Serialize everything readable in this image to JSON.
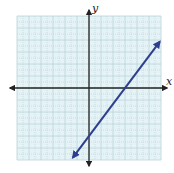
{
  "chart_data": {
    "type": "line",
    "title": "",
    "xlabel": "x",
    "ylabel": "y",
    "xlim": [
      -6,
      6
    ],
    "ylim": [
      -6,
      6
    ],
    "grid": true,
    "grid_minor": true,
    "tick_labels": false,
    "series": [
      {
        "name": "line",
        "equation": "y = (4/3)x - 4",
        "slope": 1.3333,
        "intercept": -4,
        "x_intercept": 3,
        "x": [
          -1.35,
          5.9
        ],
        "y": [
          -5.8,
          3.87
        ],
        "arrows": "both"
      }
    ]
  },
  "colors": {
    "grid_fill": "#e6f3f6",
    "grid_line": "#b9d3da",
    "axis": "#222222",
    "line": "#2e3f8f"
  }
}
